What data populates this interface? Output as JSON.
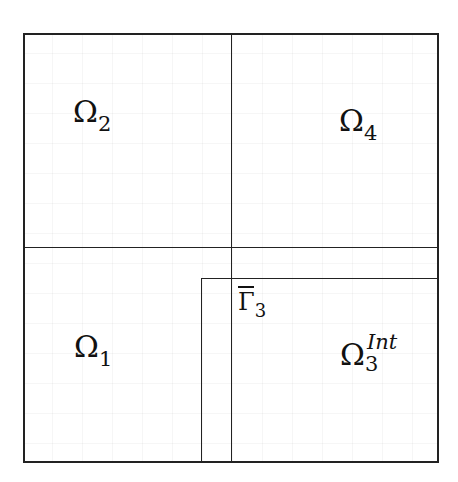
{
  "diagram": {
    "type": "domain-decomposition",
    "outer_box": {
      "x": 23,
      "y": 33,
      "width": 415,
      "height": 429
    },
    "dividers": {
      "vertical_x": 231,
      "horizontal_y": 247
    },
    "inner_box": {
      "x": 201,
      "y": 278,
      "right": 438,
      "bottom": 462
    },
    "line_color": "#222222",
    "regions": [
      {
        "id": "omega-2",
        "symbol": "Ω",
        "subscript": "2",
        "superscript": ""
      },
      {
        "id": "omega-4",
        "symbol": "Ω",
        "subscript": "4",
        "superscript": ""
      },
      {
        "id": "omega-1",
        "symbol": "Ω",
        "subscript": "1",
        "superscript": ""
      },
      {
        "id": "omega-3-int",
        "symbol": "Ω",
        "subscript": "3",
        "superscript": "Int"
      }
    ],
    "boundary_label": {
      "symbol": "Γ",
      "subscript": "3",
      "overline": true
    }
  }
}
